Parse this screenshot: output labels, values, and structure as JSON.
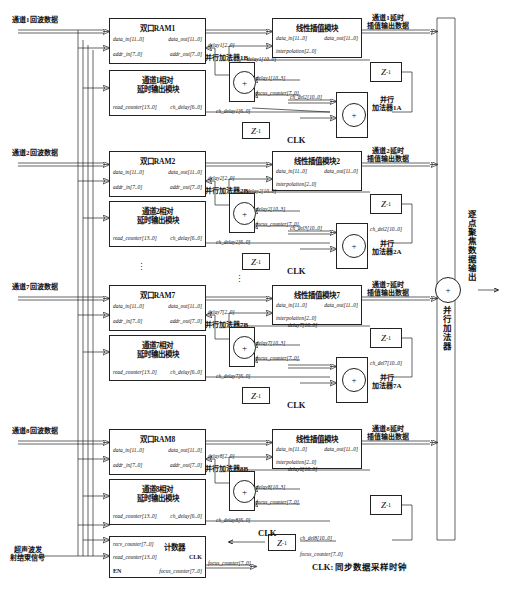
{
  "diagram": {
    "clk_legend": "CLK: 同步数据采样时钟",
    "clk_label": "CLK",
    "plus": "+",
    "ellipsis": "⋮"
  },
  "inputs": [
    {
      "id": "in1",
      "label": "通道1回波数据"
    },
    {
      "id": "in2",
      "label": "通道2回波数据"
    },
    {
      "id": "in7",
      "label": "通道7回波数据"
    },
    {
      "id": "in8",
      "label": "通道8回波数据"
    },
    {
      "id": "en",
      "label": "超声波发\n射结束信号"
    }
  ],
  "output": {
    "label": "逐点聚焦数据输出",
    "adder_label": "并行加法器"
  },
  "ports": {
    "data_in": "data_in[11..0]",
    "data_out": "data_out[11..0]",
    "addr_in": "addr_in[7..0]",
    "addr_out": "addr_out[7..0]",
    "read_counter": "read_counter[13..0]",
    "ch_delay": "ch_delay[6..0]",
    "interpolation": "interpolation[2..0]",
    "recv_counter": "recv_counter[7..0]",
    "focus_counter": "focus_counter[7..0]",
    "en": "EN"
  },
  "counter": {
    "title": "计数器",
    "clk": "CLK"
  },
  "channels": [
    {
      "n": 1,
      "ram_title": "双口RAM1",
      "delay_mod_title": "通道1相对\n延时输出模块",
      "interp_title": "线性插值模块",
      "out_label": "通道1延时\n插值输出数据",
      "adder_b_title": "并行加法器1B",
      "adder_a_title": "并行\n加法器1A",
      "sig_delay_low": "delay1[2..0]",
      "sig_delay_full": "delay1[10..0]",
      "sig_delay_high": "delay1[10..3]",
      "sig_focus": "focus_counter[7..0]",
      "sig_ch_delay": "ch_delay1[6..0]",
      "sig_ch_del_in": "ch_del2[10..0]",
      "sig_ch_del_out": "ch_del1[10..0]",
      "z_top": "Z",
      "z_top_exp": "-1",
      "z_bot": "Z",
      "z_bot_exp": "-1"
    },
    {
      "n": 2,
      "ram_title": "双口RAM2",
      "delay_mod_title": "通道2相对\n延时输出模块",
      "interp_title": "线性插值模块2",
      "out_label": "通道2延时\n插值输出数据",
      "adder_b_title": "并行加法器2B",
      "adder_a_title": "并行\n加法器2A",
      "sig_delay_low": "delay2[2..0]",
      "sig_delay_full": "delay2[10..0]",
      "sig_delay_high": "delay2[10..3]",
      "sig_focus": "focus_counter[7..0]",
      "sig_ch_delay": "ch_delay2[6..0]",
      "sig_ch_del_in": "ch_del3[10..0]",
      "sig_ch_del_out": "ch_del2[10..0]",
      "z_top": "Z",
      "z_top_exp": "-1",
      "z_bot": "Z",
      "z_bot_exp": "-1"
    },
    {
      "n": 7,
      "ram_title": "双口RAM7",
      "delay_mod_title": "通道7相对\n延时输出模块",
      "interp_title": "线性插值模块7",
      "out_label": "通道7延时\n插值输出数据",
      "adder_b_title": "并行加法器7B",
      "adder_a_title": "并行\n加法器7A",
      "sig_delay_low": "delay7[2..0]",
      "sig_delay_full": "delay7[10..0]",
      "sig_delay_high": "delay7[10..3]",
      "sig_focus": "focus_counter[7..0]",
      "sig_ch_delay": "ch_delay7[6..0]",
      "sig_ch_del_in": "ch_del8[10..0]",
      "sig_ch_del_out": "ch_del7[10..0]",
      "z_top": "Z",
      "z_top_exp": "-1",
      "z_bot": "Z",
      "z_bot_exp": "-1"
    },
    {
      "n": 8,
      "ram_title": "双口RAM8",
      "delay_mod_title": "通道8相对\n延时输出模块",
      "interp_title": "线性插值模块",
      "out_label": "通道8延时\n插值输出数据",
      "adder_b_title": "并行加法器8B",
      "adder_a_title": "",
      "sig_delay_low": "delay8[2..0]",
      "sig_delay_full": "delay8[10..0]",
      "sig_delay_high": "delay8[10..3]",
      "sig_focus": "focus_counter[7..0]",
      "sig_ch_delay": "ch_delay8[6..0]",
      "sig_ch_del_in": "",
      "sig_ch_del_out": "ch_del8[10..0]",
      "z_top": "Z",
      "z_top_exp": "-1",
      "z_bot": "Z",
      "z_bot_exp": "-1"
    }
  ]
}
